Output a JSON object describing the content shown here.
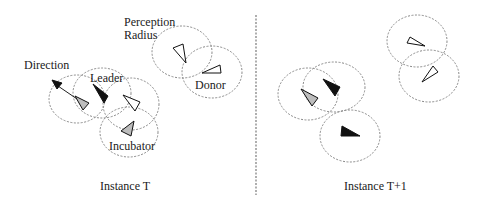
{
  "figure": {
    "panels": [
      {
        "id": "instance-t",
        "caption": "Instance T",
        "labels": {
          "direction": "Direction",
          "leader": "Leader",
          "incubator": "Incubator",
          "perception_radius": "Perception\nRadius",
          "donor": "Donor"
        }
      },
      {
        "id": "instance-t-plus-1",
        "caption": "Instance T+1"
      }
    ],
    "legend_roles": {
      "black": "Leader",
      "grey": "Incubator",
      "white": "Donor / other agent"
    },
    "colors": {
      "black_agent": "#111111",
      "grey_agent": "#bdbdbd",
      "white_agent": "#ffffff",
      "circle_stroke": "#8a8a8a",
      "divider": "#7a7a7a"
    }
  }
}
